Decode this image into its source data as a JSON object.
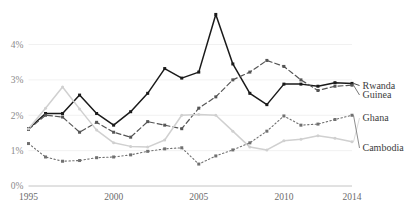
{
  "chart_data": {
    "type": "line",
    "title": "",
    "subtitle": "",
    "xlabel": "",
    "ylabel": "",
    "xlim": [
      1995,
      2014
    ],
    "ylim": [
      0,
      4.4
    ],
    "grid": true,
    "grid_axis": "y",
    "legend_position": "right-inline",
    "x": [
      1995,
      1996,
      1997,
      1998,
      1999,
      2000,
      2001,
      2002,
      2003,
      2004,
      2005,
      2006,
      2007,
      2008,
      2009,
      2010,
      2011,
      2012,
      2013,
      2014
    ],
    "y_ticks": [
      0,
      1,
      2,
      3,
      4
    ],
    "y_tick_labels": [
      "0%",
      "1%",
      "2%",
      "3%",
      "4%"
    ],
    "x_ticks": [
      1995,
      2000,
      2005,
      2010,
      2014
    ],
    "x_tick_labels": [
      "1995",
      "2000",
      "2005",
      "2010",
      "2014"
    ],
    "series": [
      {
        "name": "Rwanda",
        "label": "Rwanda",
        "style": "solid",
        "color": "#1a1a1a",
        "marker": "square",
        "values": [
          1.62,
          2.05,
          2.05,
          2.57,
          2.05,
          1.72,
          2.1,
          2.62,
          3.32,
          3.05,
          3.22,
          4.85,
          3.45,
          2.62,
          2.3,
          2.88,
          2.88,
          2.82,
          2.92,
          2.9
        ]
      },
      {
        "name": "Guinea",
        "label": "Guinea",
        "style": "dashed",
        "color": "#555555",
        "marker": "square",
        "values": [
          1.6,
          2.0,
          1.95,
          1.52,
          1.8,
          1.52,
          1.38,
          1.82,
          1.72,
          1.62,
          2.2,
          2.52,
          3.0,
          3.22,
          3.55,
          3.38,
          3.0,
          2.7,
          2.82,
          2.85
        ]
      },
      {
        "name": "Ghana",
        "label": "Ghana",
        "style": "solid-light",
        "color": "#d0d0d0",
        "marker": "circle",
        "values": [
          1.62,
          2.2,
          2.8,
          2.18,
          1.58,
          1.22,
          1.12,
          1.1,
          1.3,
          2.0,
          2.02,
          2.0,
          1.55,
          1.1,
          1.02,
          1.28,
          1.32,
          1.42,
          1.35,
          1.25
        ]
      },
      {
        "name": "Cambodia",
        "label": "Cambodia",
        "style": "dotted",
        "color": "#707070",
        "marker": "square",
        "values": [
          1.2,
          0.82,
          0.7,
          0.72,
          0.8,
          0.82,
          0.88,
          0.98,
          1.05,
          1.08,
          0.62,
          0.85,
          1.02,
          1.22,
          1.55,
          1.98,
          1.72,
          1.75,
          1.88,
          2.0
        ]
      }
    ]
  }
}
